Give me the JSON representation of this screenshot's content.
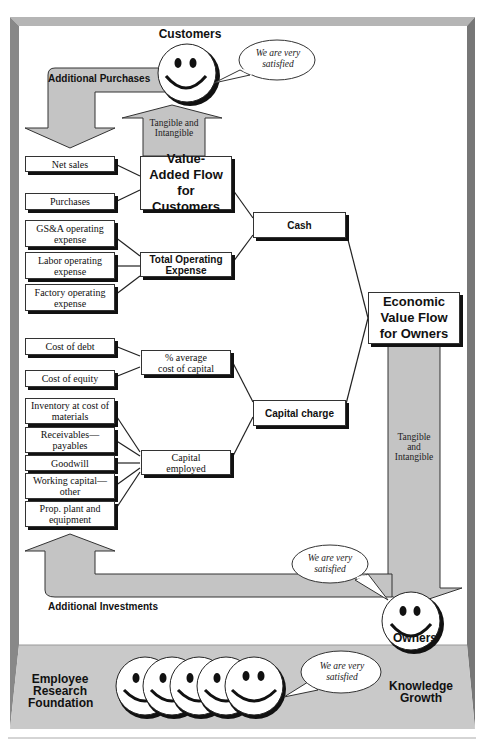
{
  "top_actor": {
    "label": "Customers",
    "speech": "We are very satisfied"
  },
  "bottom_actor": {
    "label": "Owners",
    "speech": "We are very satisfied"
  },
  "arrows": {
    "additional_purchases": "Additional Purchases",
    "additional_investments": "Additional Investments",
    "to_customers": "Tangible and Intangible",
    "to_owners": "Tangible and Intangible"
  },
  "revenue_inputs": [
    {
      "label": "Net sales"
    },
    {
      "label": "Purchases"
    }
  ],
  "expense_inputs": [
    {
      "label": "GS&A operating expense"
    },
    {
      "label": "Labor operating expense"
    },
    {
      "label": "Factory operating expense"
    }
  ],
  "capital_cost_inputs": [
    {
      "label": "Cost of debt"
    },
    {
      "label": "Cost of equity"
    }
  ],
  "capital_employed_inputs": [
    {
      "label": "Inventory at cost of materials"
    },
    {
      "label": "Receivables— payables"
    },
    {
      "label": "Goodwill"
    },
    {
      "label": "Working capital— other"
    },
    {
      "label": "Prop. plant and equipment"
    }
  ],
  "nodes": {
    "value_added": "Value-Added Flow for Customers",
    "total_opex": "Total Operating Expense",
    "avg_cost_capital": "% average cost of capital",
    "capital_employed": "Capital employed",
    "cash": "Cash",
    "capital_charge": "Capital charge",
    "economic_value": "Economic Value Flow for Owners"
  },
  "foundation_band": {
    "left_label": "Employee Research Foundation",
    "right_label": "Knowledge Growth",
    "speech": "We are very satisfied",
    "smiley_count": 5
  },
  "colors": {
    "frame_grey": "#8a8a8a",
    "arrow_grey": "#c4c4c4",
    "band_grey": "#c9c9c9",
    "box_border": "#333333"
  }
}
